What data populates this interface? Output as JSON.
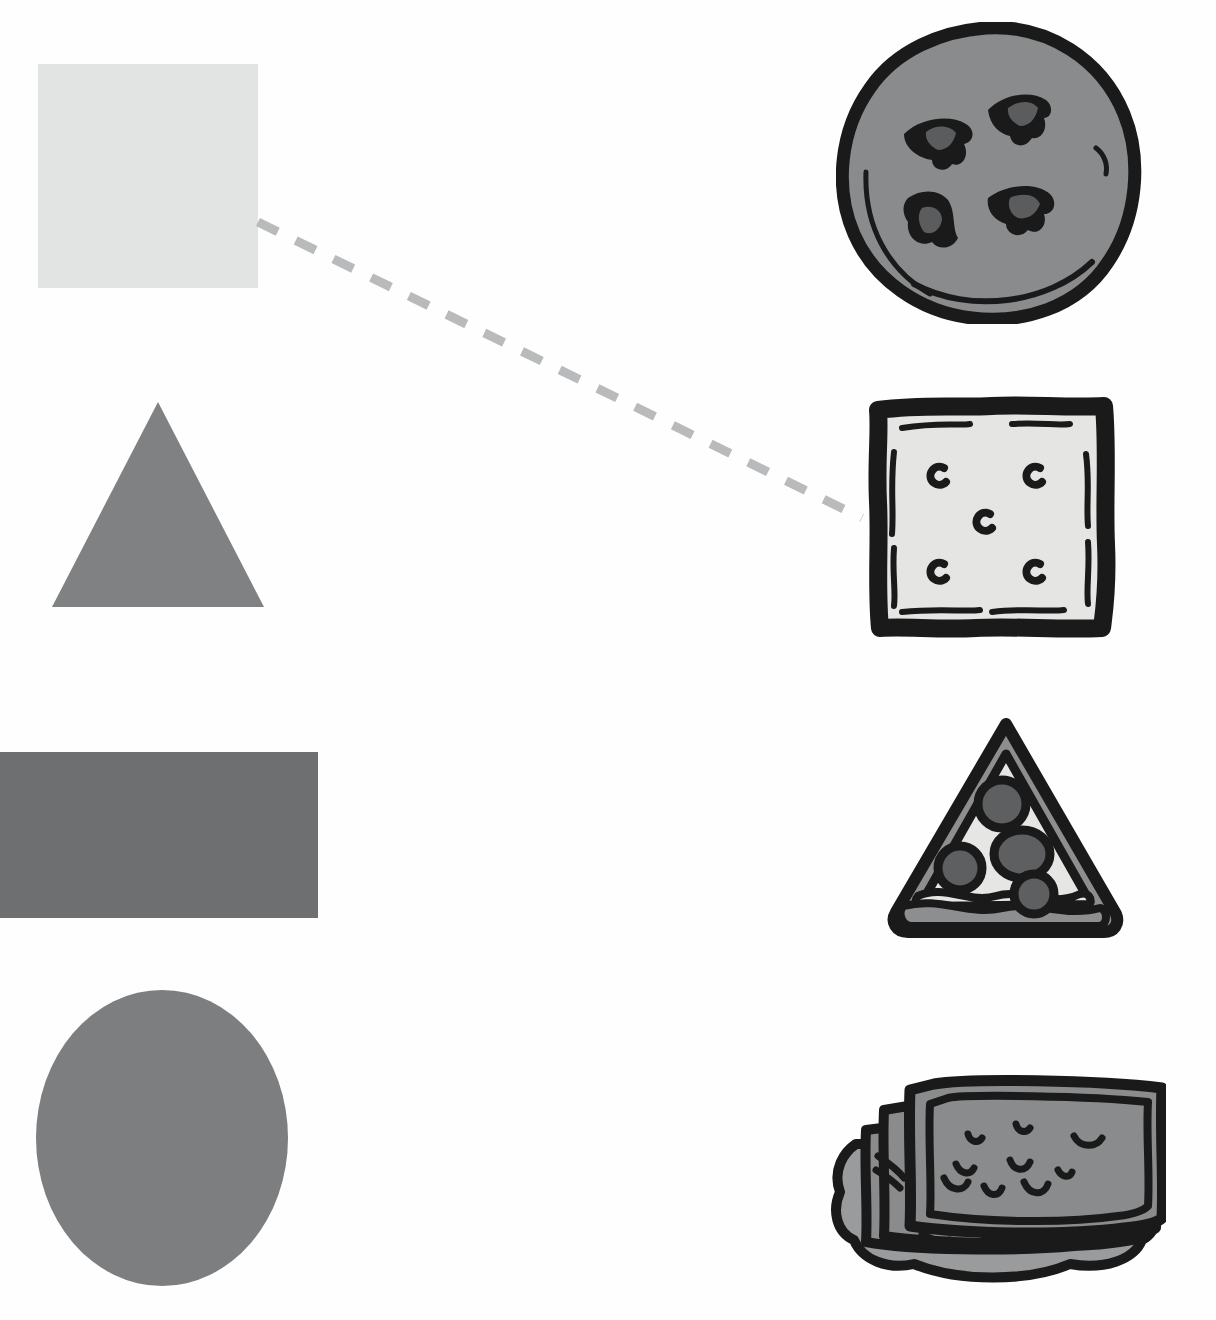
{
  "worksheet": {
    "type": "shape-to-object matching worksheet",
    "width": 1216,
    "height": 1320,
    "background_color": "#fefefe",
    "instructions_text": ""
  },
  "palette": {
    "paper": "#fefefe",
    "square_fill": "#e2e3e3",
    "triangle_fill": "#808182",
    "rectangle_fill": "#6e6f70",
    "circle_fill": "#7d7e7f",
    "ink_black": "#1a1a1a",
    "cookie_body": "#8a8b8c",
    "cookie_chip": "#5b5c5d",
    "cracker_body": "#e5e5e3",
    "pizza_cheese": "#e6e6e4",
    "pizza_crust": "#8d8e8f",
    "pepperoni": "#5e5f60",
    "sandwich_wafer": "#8a8b8c",
    "sandwich_cream": "#9a9b9c",
    "dash_line": "#b9babb"
  },
  "shapes_column": {
    "label": "shapes",
    "items": [
      {
        "id": "square",
        "name": "square",
        "fill": "#e2e3e3",
        "x": 38,
        "y": 64,
        "width": 220,
        "height": 224,
        "matched": true
      },
      {
        "id": "triangle",
        "name": "triangle",
        "fill": "#808182",
        "x": 52,
        "y": 402,
        "width": 212,
        "height": 205,
        "matched": false
      },
      {
        "id": "rectangle",
        "name": "rectangle",
        "fill": "#6e6f70",
        "x": 0,
        "y": 752,
        "width": 318,
        "height": 166,
        "matched": false
      },
      {
        "id": "circle",
        "name": "circle",
        "fill": "#7d7e7f",
        "x": 36,
        "y": 990,
        "width": 252,
        "height": 296,
        "matched": false
      }
    ]
  },
  "objects_column": {
    "label": "food objects",
    "items": [
      {
        "id": "cookie",
        "name": "chocolate chip cookie",
        "shape_match": "circle",
        "x": 836,
        "y": 22,
        "width": 306,
        "height": 302,
        "chip_count": 4,
        "matched": false
      },
      {
        "id": "cracker",
        "name": "square cracker",
        "shape_match": "square",
        "x": 864,
        "y": 392,
        "width": 254,
        "height": 248,
        "hole_count": 5,
        "matched": true
      },
      {
        "id": "pizza",
        "name": "pizza slice",
        "shape_match": "triangle",
        "x": 884,
        "y": 718,
        "width": 244,
        "height": 222,
        "pepperoni_count": 4,
        "matched": false
      },
      {
        "id": "sandwich",
        "name": "ice cream sandwich",
        "shape_match": "rectangle",
        "x": 818,
        "y": 1074,
        "width": 348,
        "height": 216,
        "chip_mark_count": 9,
        "matched": false
      }
    ]
  },
  "connections": [
    {
      "id": "square-to-cracker",
      "from": "square",
      "to": "cracker",
      "style": "dashed",
      "color": "#b9babb",
      "stroke_width": 9,
      "dash_pattern": "22 20",
      "x1": 258,
      "y1": 222,
      "x2": 862,
      "y2": 518
    }
  ]
}
